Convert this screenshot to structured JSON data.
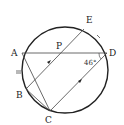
{
  "diagram": {
    "type": "circle-geometry",
    "circle": {
      "cx": 65,
      "cy": 70,
      "r": 43
    },
    "points": [
      {
        "id": "A",
        "label": "A",
        "x": 22,
        "y": 53,
        "lx": 11,
        "ly": 56
      },
      {
        "id": "P",
        "label": "P",
        "x": 58,
        "y": 53,
        "lx": 56,
        "ly": 49
      },
      {
        "id": "D",
        "label": "D",
        "x": 107,
        "y": 53,
        "lx": 109,
        "ly": 56
      },
      {
        "id": "E",
        "label": "E",
        "x": 84,
        "y": 29,
        "lx": 86,
        "ly": 23
      },
      {
        "id": "B",
        "label": "B",
        "x": 26,
        "y": 89,
        "lx": 16,
        "ly": 98
      },
      {
        "id": "C",
        "label": "C",
        "x": 50,
        "y": 111,
        "lx": 45,
        "ly": 123
      }
    ],
    "segments": [
      {
        "from": "A",
        "to": "D"
      },
      {
        "from": "A",
        "to": "C"
      },
      {
        "from": "B",
        "to": "C"
      },
      {
        "from": "B",
        "to": "E"
      },
      {
        "from": "C",
        "to": "D"
      }
    ],
    "angle_label": "46°",
    "angle_at": "D",
    "parallel_marks": [
      "BE",
      "CD"
    ],
    "equal_arc_marks": [
      "AB",
      "DE"
    ]
  }
}
